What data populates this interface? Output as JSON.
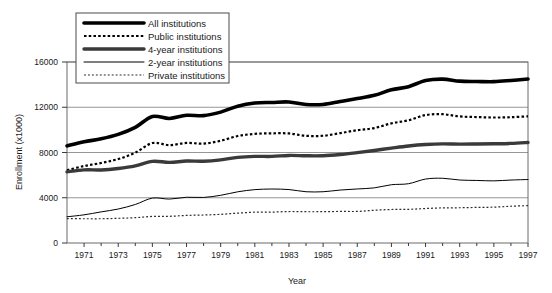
{
  "chart_data": {
    "type": "line",
    "title": "",
    "xlabel": "Year",
    "ylabel": "Enrollment (x1000)",
    "xlim": [
      1970,
      1997
    ],
    "ylim": [
      0,
      16000
    ],
    "yticks": [
      0,
      4000,
      8000,
      12000,
      16000
    ],
    "ytick_labels": [
      "0",
      "4000",
      "8000",
      "12000",
      "16000"
    ],
    "xticks": [
      1971,
      1973,
      1975,
      1977,
      1979,
      1981,
      1983,
      1985,
      1987,
      1989,
      1991,
      1993,
      1995,
      1997
    ],
    "xtick_labels": [
      "1971",
      "1973",
      "1975",
      "1977",
      "1979",
      "1981",
      "1983",
      "1985",
      "1987",
      "1989",
      "1991",
      "1993",
      "1995",
      "1997"
    ],
    "grid": "horizontal",
    "legend_position": "top-left",
    "x": [
      1970,
      1971,
      1972,
      1973,
      1974,
      1975,
      1976,
      1977,
      1978,
      1979,
      1980,
      1981,
      1982,
      1983,
      1984,
      1985,
      1986,
      1987,
      1988,
      1989,
      1990,
      1991,
      1992,
      1993,
      1994,
      1995,
      1996,
      1997
    ],
    "series": [
      {
        "name": "All institutions",
        "style": "thick-solid",
        "color": "#000000",
        "width": 3.6,
        "values": [
          8580,
          8950,
          9210,
          9600,
          10220,
          11185,
          11012,
          11286,
          11260,
          11570,
          12097,
          12372,
          12426,
          12465,
          12242,
          12247,
          12504,
          12767,
          13055,
          13539,
          13819,
          14359,
          14487,
          14305,
          14279,
          14262,
          14368,
          14502
        ]
      },
      {
        "name": "Public institutions",
        "style": "dotted-medium",
        "color": "#000000",
        "width": 2.2,
        "values": [
          6428,
          6804,
          7071,
          7420,
          7989,
          8835,
          8653,
          8847,
          8786,
          9037,
          9457,
          9647,
          9696,
          9683,
          9477,
          9479,
          9714,
          9973,
          10161,
          10578,
          10845,
          11310,
          11385,
          11189,
          11134,
          11092,
          11120,
          11196
        ]
      },
      {
        "name": "4-year institutions",
        "style": "thick-gray",
        "color": "#3a3a3a",
        "width": 3.4,
        "values": [
          6290,
          6463,
          6459,
          6590,
          6820,
          7215,
          7129,
          7243,
          7232,
          7353,
          7571,
          7655,
          7654,
          7741,
          7711,
          7716,
          7824,
          7990,
          8180,
          8388,
          8579,
          8707,
          8765,
          8739,
          8749,
          8769,
          8803,
          8890
        ]
      },
      {
        "name": "2-year institutions",
        "style": "thin-solid",
        "color": "#000000",
        "width": 1.0,
        "values": [
          2319,
          2491,
          2751,
          3004,
          3404,
          3970,
          3883,
          4043,
          4028,
          4217,
          4526,
          4717,
          4772,
          4724,
          4531,
          4531,
          4680,
          4777,
          4875,
          5151,
          5240,
          5652,
          5722,
          5566,
          5530,
          5493,
          5565,
          5612
        ]
      },
      {
        "name": "Private institutions",
        "style": "dotted-fine",
        "color": "#2a2a2a",
        "width": 1.2,
        "values": [
          2153,
          2144,
          2144,
          2183,
          2235,
          2350,
          2359,
          2439,
          2474,
          2533,
          2640,
          2725,
          2730,
          2782,
          2765,
          2768,
          2790,
          2793,
          2894,
          2961,
          2974,
          3049,
          3103,
          3116,
          3145,
          3169,
          3248,
          3306
        ]
      }
    ]
  },
  "axis": {
    "y_title": "Enrollment (x1000)",
    "x_title": "Year"
  },
  "legend": {
    "items": [
      {
        "label": "All institutions"
      },
      {
        "label": "Public institutions"
      },
      {
        "label": "4-year institutions"
      },
      {
        "label": "2-year institutions"
      },
      {
        "label": "Private institutions"
      }
    ]
  }
}
